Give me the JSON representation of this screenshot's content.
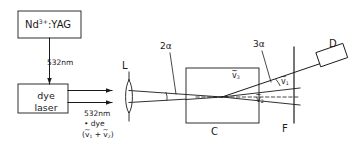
{
  "figure": {
    "type": "optical-setup-diagram",
    "line_color": "#1a1a1a",
    "background": "#ffffff"
  },
  "components": {
    "pump_laser": {
      "name": "Nd3+:YAG laser",
      "label_main": "Nd",
      "label_sup": "3+",
      "label_tail": ":YAG"
    },
    "dye_laser": {
      "name": "dye laser",
      "line1": "dye",
      "line2": "laser"
    },
    "lens": {
      "label": "L",
      "name": "focusing lens"
    },
    "cell": {
      "label": "C",
      "name": "sample cell"
    },
    "filter": {
      "label": "F",
      "name": "filter"
    },
    "detector": {
      "label": "D",
      "name": "detector"
    }
  },
  "beams": {
    "pump_wavelength": "532nm",
    "input_wavelength": "532nm",
    "input_plus": "• dye",
    "input_sum_open": "(",
    "input_sum_v1": "v",
    "input_sum_v1_sub": "1",
    "input_sum_plus": " + ",
    "input_sum_v2": "v",
    "input_sum_v2_sub": "2",
    "input_sum_close": ")",
    "tilde": "~"
  },
  "angles": {
    "crossing": "2α",
    "output": "3α"
  },
  "wavenumbers": {
    "v3": {
      "symbol": "v",
      "sub": "3"
    },
    "v1": {
      "symbol": "v",
      "sub": "1"
    },
    "v2": {
      "symbol": "v",
      "sub": "2"
    }
  }
}
